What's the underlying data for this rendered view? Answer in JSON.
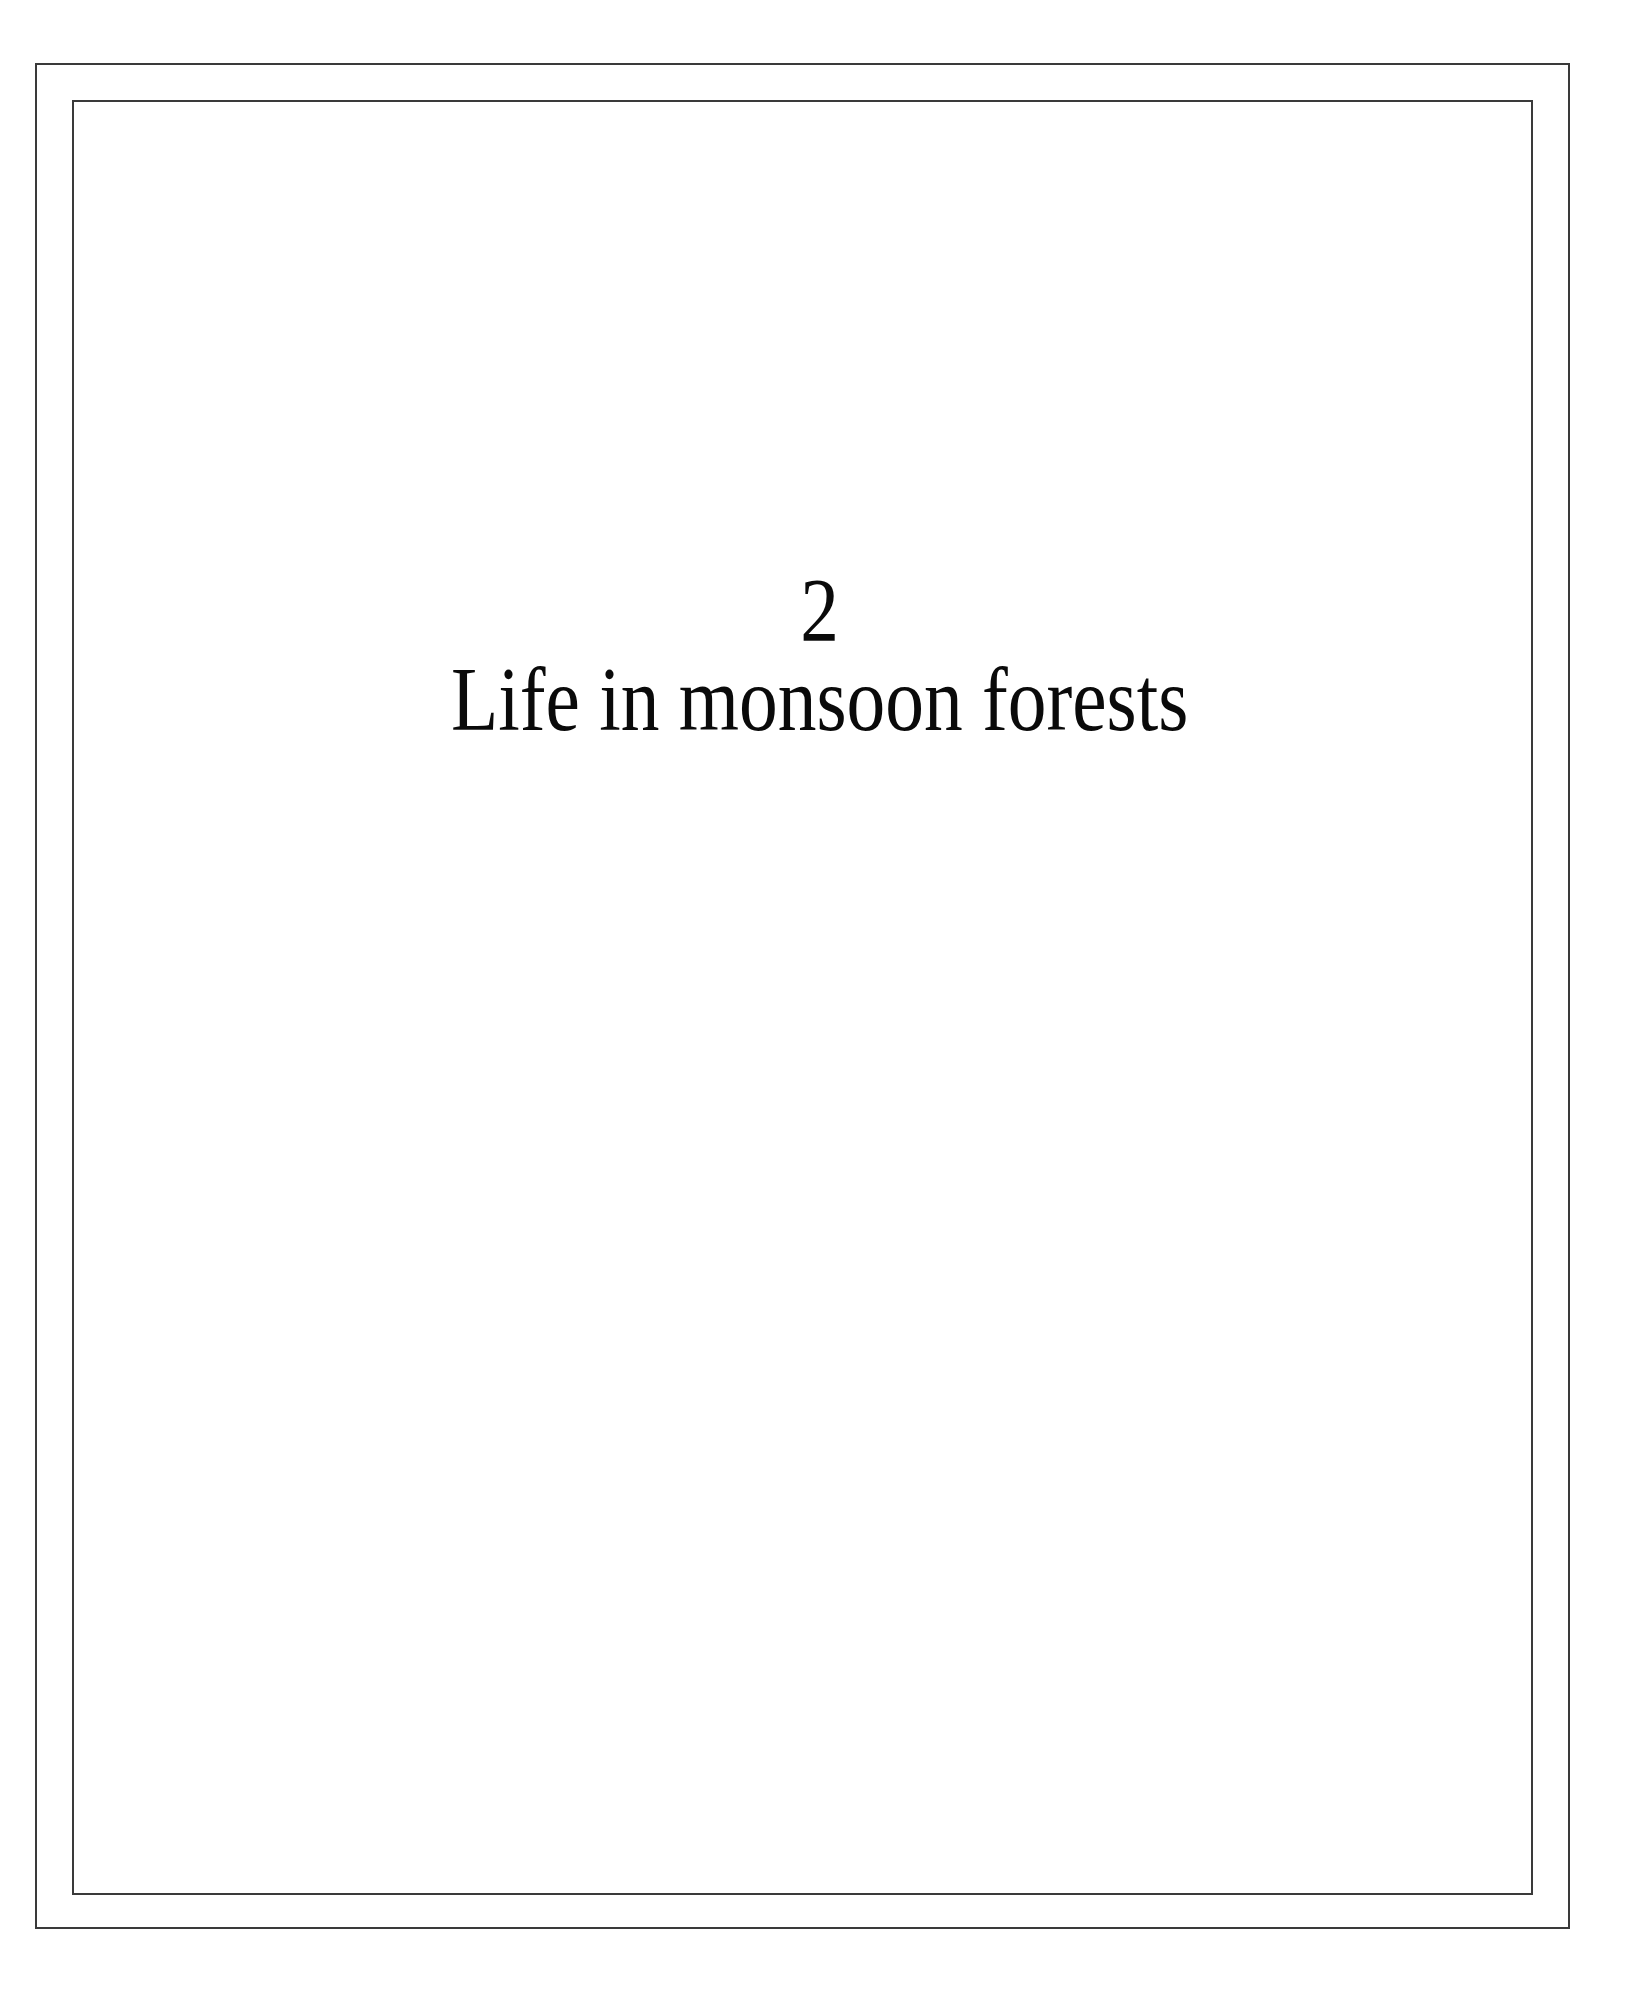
{
  "page": {
    "chapter_number": "2",
    "chapter_title": "Life in monsoon forests"
  },
  "colors": {
    "frame": "#3a3a3a",
    "text": "#0a0a0a",
    "background": "#ffffff"
  }
}
